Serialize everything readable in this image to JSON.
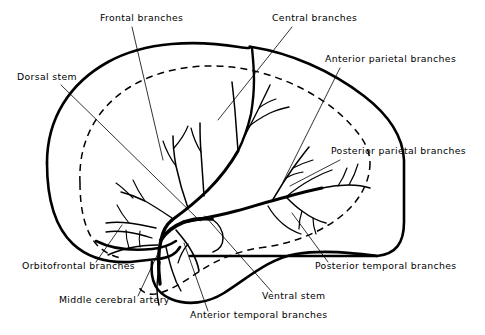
{
  "figure": {
    "background_color": "#ffffff",
    "ink_color": "#000000",
    "width": 485,
    "height": 335
  },
  "labels": {
    "frontal_branches": "Frontal branches",
    "central_branches": "Central branches",
    "anterior_parietal_branches": "Anterior parietal branches",
    "posterior_parietal_branches": "Posterior parietal branches",
    "dorsal_stem": "Dorsal stem",
    "orbitofrontal_branches": "Orbitofrontal branches",
    "middle_cerebral_artery": "Middle cerebral artery",
    "anterior_temporal_branches": "Anterior temporal branches",
    "ventral_stem": "Ventral stem",
    "posterior_temporal_branches": "Posterior temporal branches"
  },
  "label_positions": {
    "frontal_branches": {
      "x": 100,
      "y": 21,
      "anchor": "start"
    },
    "central_branches": {
      "x": 272,
      "y": 21,
      "anchor": "start"
    },
    "anterior_parietal_branches": {
      "x": 325,
      "y": 62,
      "anchor": "start"
    },
    "posterior_parietal_branches": {
      "x": 331,
      "y": 154,
      "anchor": "start"
    },
    "dorsal_stem": {
      "x": 17,
      "y": 80,
      "anchor": "start"
    },
    "orbitofrontal_branches": {
      "x": 22,
      "y": 269,
      "anchor": "start"
    },
    "middle_cerebral_artery": {
      "x": 59,
      "y": 303,
      "anchor": "start"
    },
    "anterior_temporal_branches": {
      "x": 190,
      "y": 318,
      "anchor": "start"
    },
    "ventral_stem": {
      "x": 262,
      "y": 299,
      "anchor": "start"
    },
    "posterior_temporal_branches": {
      "x": 315,
      "y": 269,
      "anchor": "start"
    }
  },
  "anatomy": {
    "structures": [
      "cerebral hemisphere outline",
      "sylvian fissure",
      "temporal lobe",
      "watershed boundary (dashed)"
    ],
    "vessel_count": 10
  }
}
